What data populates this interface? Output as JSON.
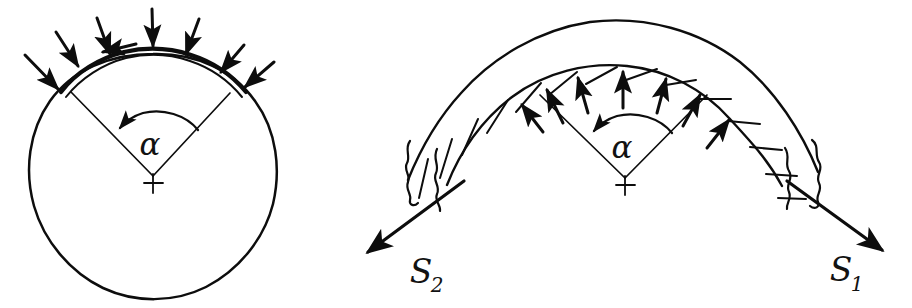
{
  "figure": {
    "background_color": "#ffffff",
    "ink_color": "#0d0d0d",
    "width": 912,
    "height": 308
  },
  "left_diagram": {
    "name": "circle-with-pressure-arrows",
    "center": {
      "x": 153,
      "y": 176,
      "marker": "+"
    },
    "radius": 122,
    "angle_label": "α",
    "angle_label_position": {
      "x": 150,
      "y": 145
    },
    "wrap_angle_degrees": 80,
    "radius_line_1_angle_deg": 130,
    "radius_line_2_angle_deg": 52,
    "pressure_arrow_count": 8,
    "pressure_arrow_direction": "inward-radial",
    "arc_band_description": "thickened contact arc over top of circle",
    "angle_arc_direction": "counterclockwise-arrowhead-left"
  },
  "right_diagram": {
    "name": "belt-band-with-tensions",
    "center": {
      "x": 625,
      "y": 178,
      "marker": "+"
    },
    "inner_radius": 118,
    "band_thickness": 32,
    "angle_label": "α",
    "angle_label_position": {
      "x": 622,
      "y": 148
    },
    "wrap_angle_degrees": 80,
    "radius_line_1_angle_deg": 130,
    "radius_line_2_angle_deg": 52,
    "pressure_arrow_count": 7,
    "pressure_arrow_direction": "outward-radial",
    "band_hatching": "diagonal short strokes",
    "break_marks": "wavy zigzag at both band ends",
    "angle_arc_direction": "counterclockwise-arrowhead-left",
    "tension_arrows": [
      {
        "label": "S₂",
        "label_base": "S",
        "label_subscript": "2",
        "label_position": {
          "x": 421,
          "y": 272
        },
        "from": {
          "x": 462,
          "y": 182
        },
        "to": {
          "x": 369,
          "y": 253
        },
        "direction": "down-left"
      },
      {
        "label": "S₁",
        "label_base": "S",
        "label_subscript": "1",
        "label_position": {
          "x": 842,
          "y": 270
        },
        "from": {
          "x": 788,
          "y": 182
        },
        "to": {
          "x": 881,
          "y": 250
        },
        "direction": "down-right"
      }
    ]
  },
  "labels": {
    "alpha_left": "α",
    "alpha_right": "α",
    "tension_s1_base": "S",
    "tension_s1_sub": "1",
    "tension_s2_base": "S",
    "tension_s2_sub": "2",
    "center_marker_left": "+",
    "center_marker_right": "+"
  }
}
